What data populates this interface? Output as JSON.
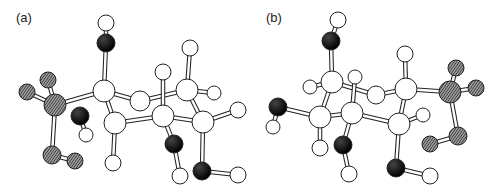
{
  "figure": {
    "panels": [
      {
        "label": "(a)",
        "atoms": [
          {
            "id": "a-h1",
            "x": 106,
            "y": 23,
            "r": 8,
            "type": "H"
          },
          {
            "id": "a-o1",
            "x": 106,
            "y": 43,
            "r": 9,
            "type": "O"
          },
          {
            "id": "a-c1",
            "x": 104,
            "y": 91,
            "r": 11,
            "type": "C"
          },
          {
            "id": "a-c2",
            "x": 140,
            "y": 101,
            "r": 10,
            "type": "C"
          },
          {
            "id": "a-c3",
            "x": 163,
            "y": 116,
            "r": 11,
            "type": "C"
          },
          {
            "id": "a-c4",
            "x": 187,
            "y": 90,
            "r": 11,
            "type": "C"
          },
          {
            "id": "a-c5",
            "x": 203,
            "y": 122,
            "r": 11,
            "type": "C"
          },
          {
            "id": "a-c6",
            "x": 115,
            "y": 123,
            "r": 11,
            "type": "C"
          },
          {
            "id": "a-h2",
            "x": 190,
            "y": 48,
            "r": 8,
            "type": "H"
          },
          {
            "id": "a-h3",
            "x": 163,
            "y": 72,
            "r": 8,
            "type": "H"
          },
          {
            "id": "a-h4",
            "x": 214,
            "y": 93,
            "r": 7,
            "type": "H"
          },
          {
            "id": "a-h5",
            "x": 238,
            "y": 110,
            "r": 8,
            "type": "H"
          },
          {
            "id": "a-p1",
            "x": 55,
            "y": 105,
            "r": 11,
            "type": "P"
          },
          {
            "id": "a-x1",
            "x": 48,
            "y": 80,
            "r": 8,
            "type": "P"
          },
          {
            "id": "a-x2",
            "x": 27,
            "y": 92,
            "r": 8,
            "type": "P"
          },
          {
            "id": "a-x3",
            "x": 52,
            "y": 155,
            "r": 9,
            "type": "P"
          },
          {
            "id": "a-x4",
            "x": 75,
            "y": 161,
            "r": 8,
            "type": "P"
          },
          {
            "id": "a-o2",
            "x": 80,
            "y": 116,
            "r": 9,
            "type": "O"
          },
          {
            "id": "a-h6",
            "x": 86,
            "y": 135,
            "r": 7,
            "type": "H"
          },
          {
            "id": "a-h7",
            "x": 113,
            "y": 163,
            "r": 8,
            "type": "H"
          },
          {
            "id": "a-o3",
            "x": 174,
            "y": 144,
            "r": 9,
            "type": "O"
          },
          {
            "id": "a-h8",
            "x": 180,
            "y": 176,
            "r": 8,
            "type": "H"
          },
          {
            "id": "a-o4",
            "x": 202,
            "y": 171,
            "r": 9,
            "type": "O"
          },
          {
            "id": "a-h9",
            "x": 238,
            "y": 175,
            "r": 8,
            "type": "H"
          }
        ],
        "bonds": [
          [
            "a-h1",
            "a-o1"
          ],
          [
            "a-o1",
            "a-c1"
          ],
          [
            "a-c1",
            "a-p1"
          ],
          [
            "a-c1",
            "a-c2"
          ],
          [
            "a-c1",
            "a-c6"
          ],
          [
            "a-c2",
            "a-c4"
          ],
          [
            "a-c6",
            "a-c3"
          ],
          [
            "a-c3",
            "a-c5"
          ],
          [
            "a-c4",
            "a-c5"
          ],
          [
            "a-c4",
            "a-h2"
          ],
          [
            "a-c3",
            "a-h3"
          ],
          [
            "a-c4",
            "a-h4"
          ],
          [
            "a-c5",
            "a-h5"
          ],
          [
            "a-p1",
            "a-x1"
          ],
          [
            "a-p1",
            "a-x2"
          ],
          [
            "a-p1",
            "a-x3"
          ],
          [
            "a-x3",
            "a-x4"
          ],
          [
            "a-o2",
            "a-h6"
          ],
          [
            "a-c6",
            "a-h7"
          ],
          [
            "a-c3",
            "a-o3"
          ],
          [
            "a-o3",
            "a-h8"
          ],
          [
            "a-c5",
            "a-o4"
          ],
          [
            "a-o4",
            "a-h9"
          ]
        ]
      },
      {
        "label": "(b)",
        "atoms": [
          {
            "id": "b-h1",
            "x": 338,
            "y": 20,
            "r": 8,
            "type": "H"
          },
          {
            "id": "b-o1",
            "x": 331,
            "y": 41,
            "r": 9,
            "type": "O"
          },
          {
            "id": "b-c1",
            "x": 332,
            "y": 82,
            "r": 11,
            "type": "C"
          },
          {
            "id": "b-h2",
            "x": 310,
            "y": 87,
            "r": 7,
            "type": "H"
          },
          {
            "id": "b-h3",
            "x": 355,
            "y": 77,
            "r": 7,
            "type": "H"
          },
          {
            "id": "b-c2",
            "x": 352,
            "y": 113,
            "r": 11,
            "type": "C"
          },
          {
            "id": "b-c3",
            "x": 320,
            "y": 117,
            "r": 11,
            "type": "C"
          },
          {
            "id": "b-c4",
            "x": 376,
            "y": 95,
            "r": 9,
            "type": "C"
          },
          {
            "id": "b-c5",
            "x": 406,
            "y": 89,
            "r": 11,
            "type": "C"
          },
          {
            "id": "b-c6",
            "x": 399,
            "y": 124,
            "r": 11,
            "type": "C"
          },
          {
            "id": "b-h4",
            "x": 423,
            "y": 115,
            "r": 7,
            "type": "H"
          },
          {
            "id": "b-h5",
            "x": 405,
            "y": 54,
            "r": 8,
            "type": "H"
          },
          {
            "id": "b-p1",
            "x": 450,
            "y": 92,
            "r": 11,
            "type": "P"
          },
          {
            "id": "b-x1",
            "x": 456,
            "y": 68,
            "r": 8,
            "type": "P"
          },
          {
            "id": "b-x2",
            "x": 476,
            "y": 88,
            "r": 8,
            "type": "P"
          },
          {
            "id": "b-x3",
            "x": 458,
            "y": 136,
            "r": 9,
            "type": "P"
          },
          {
            "id": "b-x4",
            "x": 430,
            "y": 144,
            "r": 8,
            "type": "P"
          },
          {
            "id": "b-o2",
            "x": 278,
            "y": 107,
            "r": 9,
            "type": "O"
          },
          {
            "id": "b-h6",
            "x": 273,
            "y": 127,
            "r": 7,
            "type": "H"
          },
          {
            "id": "b-h7",
            "x": 320,
            "y": 148,
            "r": 8,
            "type": "H"
          },
          {
            "id": "b-o3",
            "x": 343,
            "y": 145,
            "r": 9,
            "type": "O"
          },
          {
            "id": "b-h8",
            "x": 349,
            "y": 174,
            "r": 8,
            "type": "H"
          },
          {
            "id": "b-o4",
            "x": 396,
            "y": 168,
            "r": 9,
            "type": "O"
          },
          {
            "id": "b-h9",
            "x": 430,
            "y": 176,
            "r": 8,
            "type": "H"
          }
        ],
        "bonds": [
          [
            "b-h1",
            "b-o1"
          ],
          [
            "b-o1",
            "b-c1"
          ],
          [
            "b-c1",
            "b-h2"
          ],
          [
            "b-c1",
            "b-c3"
          ],
          [
            "b-c1",
            "b-c4"
          ],
          [
            "b-c2",
            "b-h3"
          ],
          [
            "b-c3",
            "b-c2"
          ],
          [
            "b-c2",
            "b-c6"
          ],
          [
            "b-c4",
            "b-c5"
          ],
          [
            "b-c5",
            "b-c6"
          ],
          [
            "b-c6",
            "b-h4"
          ],
          [
            "b-c5",
            "b-h5"
          ],
          [
            "b-c5",
            "b-p1"
          ],
          [
            "b-p1",
            "b-x1"
          ],
          [
            "b-p1",
            "b-x2"
          ],
          [
            "b-p1",
            "b-x3"
          ],
          [
            "b-x3",
            "b-x4"
          ],
          [
            "b-o2",
            "b-c3"
          ],
          [
            "b-o2",
            "b-h6"
          ],
          [
            "b-c3",
            "b-h7"
          ],
          [
            "b-c2",
            "b-o3"
          ],
          [
            "b-o3",
            "b-h8"
          ],
          [
            "b-c6",
            "b-o4"
          ],
          [
            "b-o4",
            "b-h9"
          ]
        ]
      }
    ],
    "colors": {
      "H": "#ffffff",
      "C": "#ffffff",
      "O": "#111111",
      "P": "#555555",
      "stroke": "#222222",
      "bond": "#ffffff"
    }
  }
}
